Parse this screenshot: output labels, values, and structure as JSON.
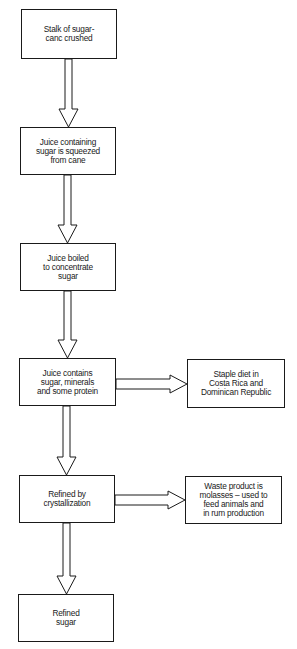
{
  "diagram": {
    "type": "flowchart",
    "steps": [
      {
        "id": "s1",
        "label": "Stalk of sugar-\ncanc crushed"
      },
      {
        "id": "s2",
        "label": "Juice containing\nsugar is squeezed\nfrom cane"
      },
      {
        "id": "s3",
        "label": "Juice boiled\nto concentrate\nsugar"
      },
      {
        "id": "s4",
        "label": "Juice contains\nsugar, minerals\nand some protein"
      },
      {
        "id": "s5",
        "label": "Refined by\ncrystallization"
      },
      {
        "id": "s6",
        "label": "Refined\nsugar"
      }
    ],
    "side_outputs": [
      {
        "id": "o1",
        "from": "s4",
        "label": "Staple diet in\nCosta Rica and\nDominican Republic"
      },
      {
        "id": "o2",
        "from": "s5",
        "label": "Waste product is\nmolasses – used to\nfeed animals and\nin rum production"
      }
    ],
    "edges": [
      {
        "from": "s1",
        "to": "s2"
      },
      {
        "from": "s2",
        "to": "s3"
      },
      {
        "from": "s3",
        "to": "s4"
      },
      {
        "from": "s4",
        "to": "s5"
      },
      {
        "from": "s5",
        "to": "s6"
      },
      {
        "from": "s4",
        "to": "o1"
      },
      {
        "from": "s5",
        "to": "o2"
      }
    ]
  }
}
